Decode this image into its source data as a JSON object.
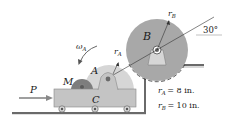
{
  "figure": {
    "labels": {
      "disk_b": "B",
      "disk_a": "A",
      "motor": "M",
      "cart": "C",
      "force": "P",
      "omega": "ω",
      "omega_sub": "A",
      "r_a": "r",
      "r_a_sub": "A",
      "r_b": "r",
      "r_b_sub": "B",
      "angle": "30°"
    },
    "given": [
      {
        "symbol": "r",
        "sub": "A",
        "value": "= 8 in."
      },
      {
        "symbol": "r",
        "sub": "B",
        "value": "= 10 in."
      }
    ],
    "colors": {
      "disk_b": "#a8a8a8",
      "disk_a": "#d6d6d6",
      "motor": "#7d7d7d",
      "cart": "#c4c4c4",
      "ground": "#6a6a6a",
      "line": "#333333"
    }
  }
}
